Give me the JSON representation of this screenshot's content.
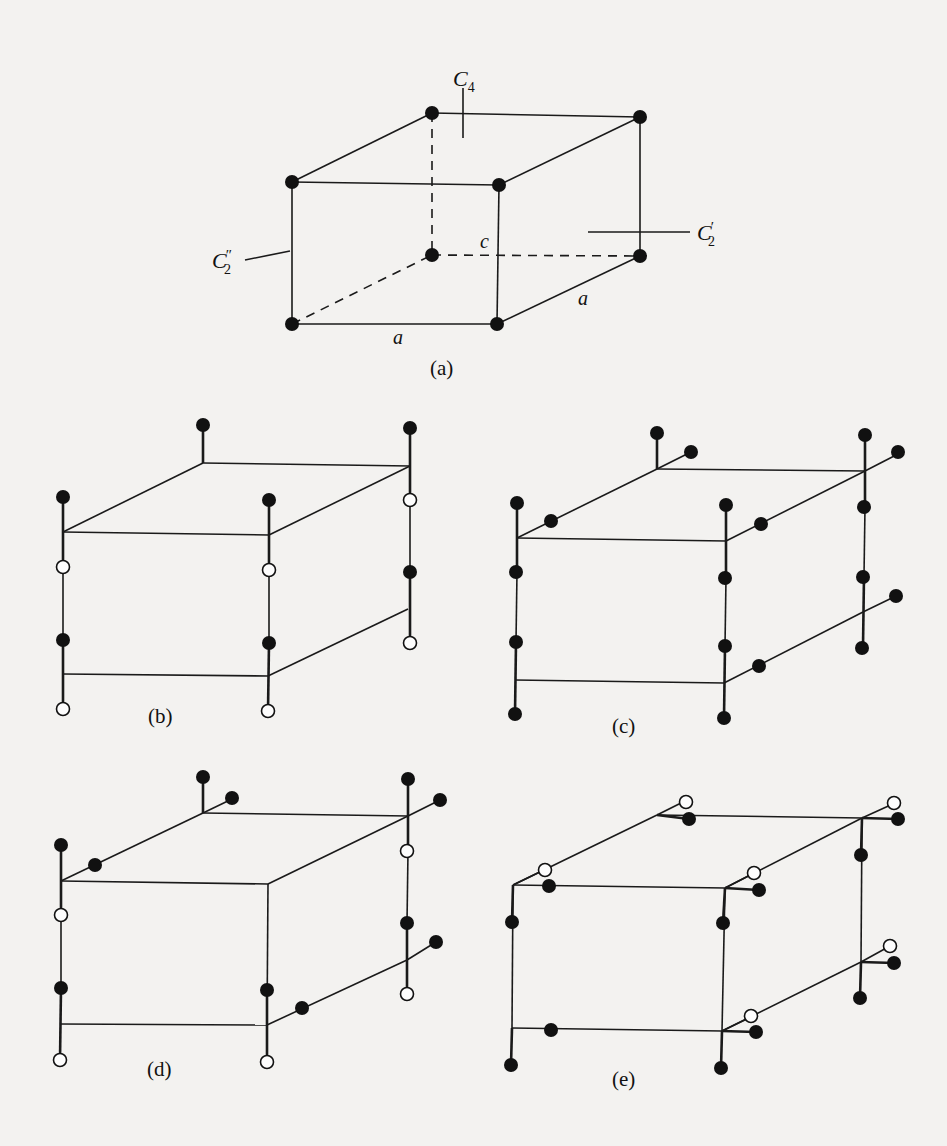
{
  "figure": {
    "panels": [
      {
        "id": "a",
        "caption": "(a)"
      },
      {
        "id": "b",
        "caption": "(b)"
      },
      {
        "id": "c",
        "caption": "(c)"
      },
      {
        "id": "d",
        "caption": "(d)"
      },
      {
        "id": "e",
        "caption": "(e)"
      }
    ],
    "labels": {
      "c4": {
        "base": "C",
        "sub": "4"
      },
      "c2prime": {
        "base": "C",
        "sup": "′",
        "sub": "2"
      },
      "c2dprime": {
        "base": "C",
        "sup": "″",
        "sub": "2"
      },
      "edge_a_front": "a",
      "edge_a_side": "a",
      "edge_c": "c"
    },
    "legend": {
      "filled_circle": "filled atom",
      "open_circle": "open atom"
    },
    "colors": {
      "ink": "#111111",
      "paper": "#f3f2f0"
    }
  }
}
